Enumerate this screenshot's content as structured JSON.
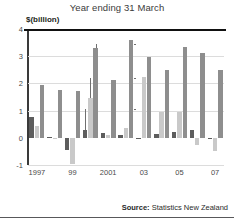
{
  "chart_data": {
    "type": "bar",
    "title": "Year ending 31 March",
    "ylabel": "$(billion)",
    "xlabel": "",
    "ylim": [
      -1,
      4
    ],
    "yticks": [
      "4",
      "3",
      "2",
      "1",
      "0",
      "-1"
    ],
    "grid": true,
    "legend_position": "annotations-inline",
    "categories": [
      "1997",
      "1998",
      "1999",
      "2000",
      "2001",
      "2002",
      "2003",
      "2004",
      "2005",
      "2006",
      "2007"
    ],
    "xtick_labels": [
      "1997",
      "99",
      "2001",
      "03",
      "05",
      "07"
    ],
    "xtick_categories": [
      "1997",
      "1999",
      "2001",
      "2003",
      "2005",
      "2007"
    ],
    "series": [
      {
        "name": "Primary",
        "color": "#5d5d5d",
        "values": [
          0.75,
          0.02,
          -0.45,
          0.27,
          0.18,
          0.1,
          0.0,
          0.15,
          0.22,
          0.27,
          0.0
        ]
      },
      {
        "name": "Goods",
        "color": "#c9c9c9",
        "values": [
          0.45,
          0.0,
          -0.95,
          1.45,
          0.1,
          0.35,
          2.25,
          0.95,
          0.95,
          -0.25,
          -0.5
        ]
      },
      {
        "name": "Services",
        "color": "#8e8e8e",
        "values": [
          1.95,
          1.75,
          1.72,
          3.3,
          2.12,
          3.6,
          2.98,
          2.5,
          3.35,
          3.1,
          2.5
        ]
      }
    ],
    "annotations": [
      {
        "label": "Services",
        "points_to_category": "2000",
        "points_to_series": "Services"
      },
      {
        "label": "Goods",
        "points_to_category": "2000",
        "points_to_series": "Goods"
      },
      {
        "label": "Primary",
        "points_to_category": "2000",
        "points_to_series": "Primary"
      }
    ]
  },
  "source": {
    "prefix": "Source:",
    "text": "Statistics New Zealand"
  }
}
